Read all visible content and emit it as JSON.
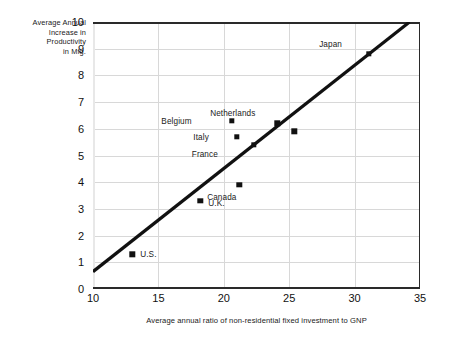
{
  "chart_data": {
    "type": "scatter",
    "title": "",
    "xlabel": "Average annual ratio of non-residential fixed investment to GNP",
    "ylabel_lines": [
      "Average Annual",
      "Increase in",
      "Productivity",
      "in Mfg."
    ],
    "ylabel": "Average Annual Increase in Productivity in Mfg.",
    "xlim": [
      10,
      35
    ],
    "ylim": [
      0,
      10
    ],
    "xticks": [
      "10",
      "15",
      "20",
      "25",
      "30",
      "35"
    ],
    "yticks": [
      "0",
      "1",
      "2",
      "3",
      "4",
      "5",
      "6",
      "7",
      "8",
      "9",
      "10"
    ],
    "grid": true,
    "legend": "none",
    "marker_color": "#111111",
    "line_color": "#111111",
    "points": [
      {
        "label": "U.S.",
        "x": 13.0,
        "y": 1.3,
        "label_dx": 8,
        "label_dy": 0
      },
      {
        "label": "U.K.",
        "x": 18.2,
        "y": 3.3,
        "label_dx": 8,
        "label_dy": 2
      },
      {
        "label": "Canada",
        "x": 21.2,
        "y": 3.9,
        "label_dx": -3,
        "label_dy": 12
      },
      {
        "label": "Italy",
        "x": 21.0,
        "y": 5.7,
        "label_dx": -28,
        "label_dy": 0
      },
      {
        "label": "France",
        "x": 22.3,
        "y": 5.4,
        "label_dx": -36,
        "label_dy": 9
      },
      {
        "label": "Belgium",
        "x": 20.6,
        "y": 6.3,
        "label_dx": -40,
        "label_dy": 0
      },
      {
        "label": "Netherlands",
        "x": 24.1,
        "y": 6.2,
        "label_dx": -22,
        "label_dy": -10
      },
      {
        "label": "",
        "x": 25.4,
        "y": 5.9,
        "label_dx": 0,
        "label_dy": 0
      },
      {
        "label": "Japan",
        "x": 31.1,
        "y": 8.8,
        "label_dx": -27,
        "label_dy": -10
      }
    ],
    "trendline": {
      "x0": 10,
      "y0": 0.65,
      "x1": 34.2,
      "y1": 10.0
    }
  }
}
